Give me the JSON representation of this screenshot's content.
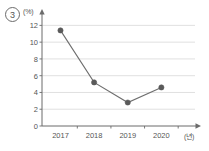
{
  "figure": {
    "item_number": "3",
    "y_unit_label": "(%)",
    "x_unit_label": "(년)"
  },
  "colors": {
    "axis": "#6b6b6b",
    "grid": "#d8d8d8",
    "line": "#6e6e6e",
    "marker": "#5a5a5a",
    "text": "#555555"
  },
  "chart_data": {
    "type": "line",
    "title": "",
    "xlabel": "(년)",
    "ylabel": "(%)",
    "categories": [
      "2017",
      "2018",
      "2019",
      "2020"
    ],
    "values": [
      11.4,
      5.2,
      2.8,
      4.6
    ],
    "series": [
      {
        "name": "",
        "values": [
          11.4,
          5.2,
          2.8,
          4.6
        ]
      }
    ],
    "ylim": [
      0,
      13
    ],
    "yticks": [
      0,
      2,
      4,
      6,
      8,
      10,
      12
    ],
    "ytick_labels": [
      "0",
      "2",
      "4",
      "6",
      "8",
      "10",
      "12"
    ],
    "xtick_labels": [
      "2017",
      "2018",
      "2019",
      "2020"
    ],
    "grid": "horizontal",
    "legend": "none",
    "marker": "circle"
  }
}
